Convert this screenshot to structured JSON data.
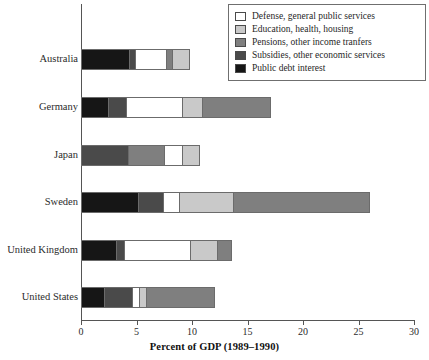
{
  "chart_data": {
    "type": "bar",
    "orientation": "horizontal",
    "stacked": true,
    "title": "",
    "xlabel": "Percent of GDP (1989–1990)",
    "ylabel": "",
    "xlim": [
      0,
      30
    ],
    "xticks": [
      0,
      5,
      10,
      15,
      20,
      25,
      30
    ],
    "xtick_labels": [
      "0",
      "5",
      "10",
      "15",
      "20",
      "25",
      "30"
    ],
    "grid": false,
    "legend_position": "top-right",
    "categories": [
      "Australia",
      "Germany",
      "Japan",
      "Sweden",
      "United Kingdom",
      "United States"
    ],
    "series": [
      {
        "name": "Defense, general public services",
        "color": "#ffffff",
        "values": [
          2.8,
          5.0,
          1.6,
          1.4,
          5.9,
          0.6
        ]
      },
      {
        "name": "Education, health, housing",
        "color": "#c9c9c9",
        "values": [
          1.7,
          1.8,
          1.7,
          4.9,
          2.5,
          0.7
        ]
      },
      {
        "name": "Pensions, other income tranfers",
        "color": "#7f7f7f",
        "values": [
          0.5,
          6.3,
          3.3,
          12.4,
          1.4,
          6.3
        ]
      },
      {
        "name": "Subsidies, other economic services",
        "color": "#4a4a4a",
        "values": [
          0.6,
          1.7,
          4.1,
          2.3,
          0.7,
          2.5
        ]
      },
      {
        "name": "Public debt interest",
        "color": "#161616",
        "values": [
          4.2,
          2.3,
          0.0,
          5.0,
          3.1,
          2.0
        ]
      }
    ],
    "totals": [
      10.3,
      17.1,
      10.7,
      26.0,
      13.6,
      12.2
    ],
    "segment_draw_order": [
      "Public debt interest",
      "Subsidies, other economic services",
      "Defense, general public services",
      "Pensions, other income tranfers",
      "Education, health, housing"
    ],
    "bars": [
      {
        "category": "Australia",
        "segments": [
          {
            "series": "Public debt interest",
            "value": 4.2,
            "color": "#161616"
          },
          {
            "series": "Subsidies, other economic services",
            "value": 0.6,
            "color": "#4a4a4a"
          },
          {
            "series": "Defense, general public services",
            "value": 2.8,
            "color": "#ffffff"
          },
          {
            "series": "Pensions, other income tranfers",
            "value": 0.5,
            "color": "#7f7f7f"
          },
          {
            "series": "Education, health, housing",
            "value": 1.7,
            "color": "#c9c9c9"
          }
        ]
      },
      {
        "category": "Germany",
        "segments": [
          {
            "series": "Public debt interest",
            "value": 2.3,
            "color": "#161616"
          },
          {
            "series": "Subsidies, other economic services",
            "value": 1.7,
            "color": "#4a4a4a"
          },
          {
            "series": "Defense, general public services",
            "value": 5.0,
            "color": "#ffffff"
          },
          {
            "series": "Education, health, housing",
            "value": 1.8,
            "color": "#c9c9c9"
          },
          {
            "series": "Pensions, other income tranfers",
            "value": 6.3,
            "color": "#7f7f7f"
          }
        ]
      },
      {
        "category": "Japan",
        "segments": [
          {
            "series": "Subsidies, other economic services",
            "value": 4.1,
            "color": "#4a4a4a"
          },
          {
            "series": "Pensions, other income tranfers",
            "value": 3.3,
            "color": "#7f7f7f"
          },
          {
            "series": "Defense, general public services",
            "value": 1.6,
            "color": "#ffffff"
          },
          {
            "series": "Education, health, housing",
            "value": 1.7,
            "color": "#c9c9c9"
          }
        ]
      },
      {
        "category": "Sweden",
        "segments": [
          {
            "series": "Public debt interest",
            "value": 5.0,
            "color": "#161616"
          },
          {
            "series": "Subsidies, other economic services",
            "value": 2.3,
            "color": "#4a4a4a"
          },
          {
            "series": "Defense, general public services",
            "value": 1.4,
            "color": "#ffffff"
          },
          {
            "series": "Education, health, housing",
            "value": 4.9,
            "color": "#c9c9c9"
          },
          {
            "series": "Pensions, other income tranfers",
            "value": 12.4,
            "color": "#7f7f7f"
          }
        ]
      },
      {
        "category": "United Kingdom",
        "segments": [
          {
            "series": "Public debt interest",
            "value": 3.1,
            "color": "#161616"
          },
          {
            "series": "Subsidies, other economic services",
            "value": 0.7,
            "color": "#4a4a4a"
          },
          {
            "series": "Defense, general public services",
            "value": 5.9,
            "color": "#ffffff"
          },
          {
            "series": "Education, health, housing",
            "value": 2.5,
            "color": "#c9c9c9"
          },
          {
            "series": "Pensions, other income tranfers",
            "value": 1.4,
            "color": "#7f7f7f"
          }
        ]
      },
      {
        "category": "United States",
        "segments": [
          {
            "series": "Public debt interest",
            "value": 2.0,
            "color": "#161616"
          },
          {
            "series": "Subsidies, other economic services",
            "value": 2.5,
            "color": "#4a4a4a"
          },
          {
            "series": "Defense, general public services",
            "value": 0.6,
            "color": "#ffffff"
          },
          {
            "series": "Education, health, housing",
            "value": 0.7,
            "color": "#c9c9c9"
          },
          {
            "series": "Pensions, other income tranfers",
            "value": 6.3,
            "color": "#7f7f7f"
          }
        ]
      }
    ]
  },
  "legend": {
    "items": [
      {
        "label": "Defense, general public services",
        "color": "#ffffff"
      },
      {
        "label": "Education, health, housing",
        "color": "#c9c9c9"
      },
      {
        "label": "Pensions, other income tranfers",
        "color": "#7f7f7f"
      },
      {
        "label": "Subsidies, other economic services",
        "color": "#4a4a4a"
      },
      {
        "label": "Public debt interest",
        "color": "#161616"
      }
    ]
  }
}
